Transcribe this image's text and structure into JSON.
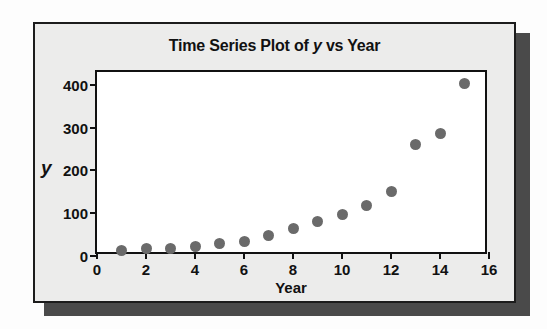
{
  "figure": {
    "title_prefix": "Time Series Plot of ",
    "title_italic": "y",
    "title_suffix": " vs Year",
    "title_full": "Time Series Plot of y vs Year",
    "marker_color": "#6a6a6a",
    "frame_color": "#111111",
    "card_color": "#ececeb",
    "shadow_color": "#4a4a4a"
  },
  "background": {
    "showthrough_lines": [
      "Time Model Resid",
      "Residual Plot",
      "Copy and",
      "Important"
    ]
  },
  "chart_data": {
    "type": "scatter",
    "title": "Time Series Plot of y vs Year",
    "xlabel": "Year",
    "ylabel": "y",
    "xlim": [
      0,
      16
    ],
    "ylim": [
      0,
      430
    ],
    "grid": false,
    "legend": null,
    "xticks": [
      0,
      2,
      4,
      6,
      8,
      10,
      12,
      14,
      16
    ],
    "xtick_labels": [
      "0",
      "2",
      "4",
      "6",
      "8",
      "10",
      "12",
      "14",
      "16"
    ],
    "yticks": [
      0,
      100,
      200,
      300,
      400
    ],
    "ytick_labels": [
      "0",
      "100",
      "200",
      "300",
      "400"
    ],
    "series": [
      {
        "name": "y",
        "x": [
          1,
          2,
          3,
          4,
          5,
          6,
          7,
          8,
          9,
          10,
          11,
          12,
          13,
          14,
          15
        ],
        "values": [
          12,
          18,
          18,
          22,
          30,
          35,
          48,
          65,
          80,
          97,
          119,
          151,
          260,
          286,
          403
        ]
      }
    ]
  }
}
